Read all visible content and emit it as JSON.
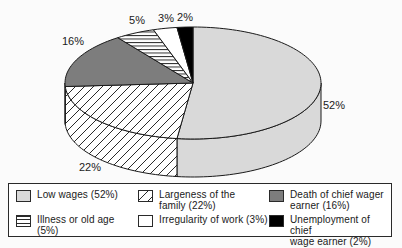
{
  "chart_data": {
    "type": "pie",
    "style": "3d-pie",
    "unit": "percent",
    "clockwise_from_top": true,
    "title": "",
    "slices": [
      {
        "label": "Low wages",
        "value": 52,
        "pct_label": "52%",
        "pattern": "solid",
        "color": "#d9d9d9"
      },
      {
        "label": "Largeness of the family",
        "value": 22,
        "pct_label": "22%",
        "pattern": "diagonal-hatch",
        "color": "#ffffff"
      },
      {
        "label": "Death of chief wager earner",
        "value": 16,
        "pct_label": "16%",
        "pattern": "solid",
        "color": "#7d7d7d"
      },
      {
        "label": "Illness or old age",
        "value": 5,
        "pct_label": "5%",
        "pattern": "horizontal-stripes",
        "color": "#ffffff"
      },
      {
        "label": "Irregularity of work",
        "value": 3,
        "pct_label": "3%",
        "pattern": "solid",
        "color": "#ffffff"
      },
      {
        "label": "Unemployment of chief wage earner",
        "value": 2,
        "pct_label": "2%",
        "pattern": "solid",
        "color": "#000000"
      }
    ],
    "pct_label_positions": [
      {
        "text": "52%",
        "x": 334,
        "y": 106
      },
      {
        "text": "22%",
        "x": 90,
        "y": 168
      },
      {
        "text": "16%",
        "x": 73,
        "y": 42
      },
      {
        "text": "5%",
        "x": 137,
        "y": 21
      },
      {
        "text": "3%",
        "x": 166,
        "y": 19
      },
      {
        "text": "2%",
        "x": 185,
        "y": 18
      }
    ],
    "outline_color": "#1a1a1a",
    "pattern_line_color": "#2a2a2a",
    "legend_position": "bottom"
  },
  "legend": {
    "items": [
      {
        "lines": [
          "Low wages (52%)"
        ],
        "pattern": "solid",
        "color": "#d9d9d9"
      },
      {
        "lines": [
          "Largeness of the",
          "family (22%)"
        ],
        "pattern": "diagonal-hatch",
        "color": "#ffffff"
      },
      {
        "lines": [
          "Death of chief wager",
          "earner (16%)"
        ],
        "pattern": "solid",
        "color": "#7d7d7d"
      },
      {
        "lines": [
          "Illness or old age (5%)"
        ],
        "pattern": "horizontal-stripes",
        "color": "#ffffff"
      },
      {
        "lines": [
          "Irregularity of work (3%)"
        ],
        "pattern": "solid",
        "color": "#ffffff"
      },
      {
        "lines": [
          "Unemployment of chief",
          "wage earner (2%)"
        ],
        "pattern": "solid",
        "color": "#000000"
      }
    ]
  }
}
